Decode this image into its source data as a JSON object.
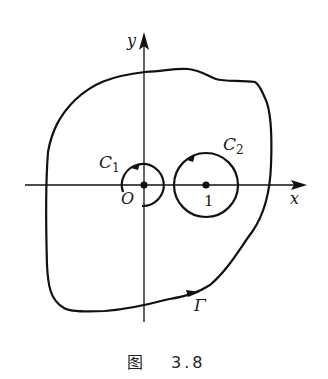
{
  "figure": {
    "caption_prefix": "图",
    "caption_number": "3.8",
    "axes": {
      "x_label": "x",
      "y_label": "y",
      "origin_label": "O",
      "point_label": "1"
    },
    "curves": {
      "outer_contour_label": "Γ",
      "circle_1_label": "C",
      "circle_1_subscript": "1",
      "circle_2_label": "C",
      "circle_2_subscript": "2"
    },
    "colors": {
      "ink": "#111111",
      "background": "#ffffff"
    }
  }
}
